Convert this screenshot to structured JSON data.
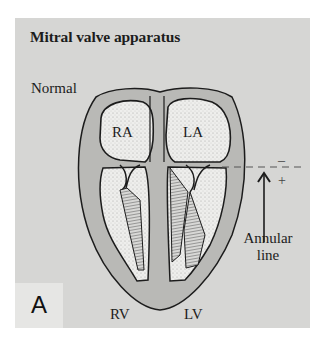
{
  "figure": {
    "title": "Mitral valve apparatus",
    "variant_label": "Normal",
    "panel_letter": "A",
    "chambers": {
      "right_atrium": "RA",
      "left_atrium": "LA",
      "right_ventricle": "RV",
      "left_ventricle": "LV"
    },
    "annular_line": {
      "label_line1": "Annular",
      "label_line2": "line",
      "above_sign": "–",
      "below_sign": "+"
    },
    "colors": {
      "panel_background": "#d6d6d4",
      "heart_wall": "#b9b9b6",
      "chamber_fill": "#eeeeec",
      "outline": "#1c1c1c"
    }
  }
}
